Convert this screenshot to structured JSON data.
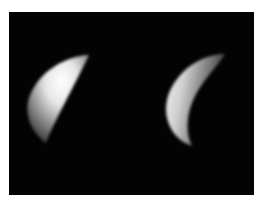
{
  "image": {
    "description": "Two crescent-lit celestial bodies (moon phases) side by side against black space",
    "background_color": "#030303",
    "border_color": "#ffffff",
    "subjects": [
      {
        "name": "left-crescent",
        "lit_side": "left",
        "brightest_region": "upper-center",
        "tone": "#e8e8e8"
      },
      {
        "name": "right-crescent",
        "lit_side": "left",
        "brightest_region": "left-edge",
        "tone": "#dcdcdc"
      }
    ]
  }
}
